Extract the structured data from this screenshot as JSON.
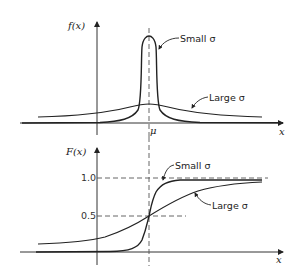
{
  "top_plot": {
    "y_label": "f(x)",
    "x_label": "x",
    "mean_label": "μ",
    "curves": [
      {
        "name": "small-sigma",
        "label": "Small σ"
      },
      {
        "name": "large-sigma",
        "label": "Large σ"
      }
    ]
  },
  "bottom_plot": {
    "y_label": "F(x)",
    "x_label": "x",
    "y_ticks": [
      "1.0",
      "0.5"
    ],
    "curves": [
      {
        "name": "small-sigma",
        "label": "Small σ"
      },
      {
        "name": "large-sigma",
        "label": "Large σ"
      }
    ]
  },
  "colors": {
    "ink": "#222222",
    "dash": "#555555"
  }
}
